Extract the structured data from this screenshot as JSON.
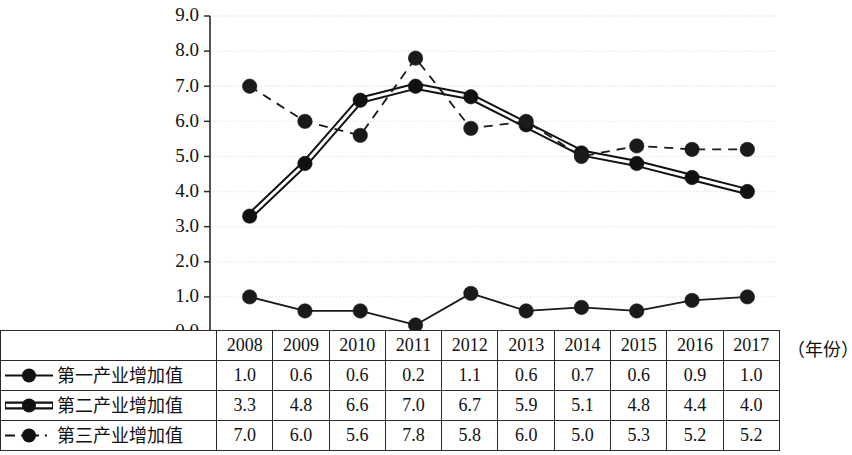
{
  "chart_data": {
    "type": "line",
    "title": "",
    "xlabel": "（年份）",
    "ylabel": "",
    "categories": [
      "2008",
      "2009",
      "2010",
      "2011",
      "2012",
      "2013",
      "2014",
      "2015",
      "2016",
      "2017"
    ],
    "ylim": [
      0.0,
      9.0
    ],
    "ytick_step": 1.0,
    "yticks": [
      "0.0",
      "1.0",
      "2.0",
      "3.0",
      "4.0",
      "5.0",
      "6.0",
      "7.0",
      "8.0",
      "9.0"
    ],
    "grid": true,
    "legend_position": "table-left-column",
    "series": [
      {
        "name": "第一产业增加值",
        "style": "solid-thin",
        "marker": "filled-circle",
        "color": "#1a1a1a",
        "values": [
          1.0,
          0.6,
          0.6,
          0.2,
          1.1,
          0.6,
          0.7,
          0.6,
          0.9,
          1.0
        ]
      },
      {
        "name": "第二产业增加值",
        "style": "double-solid-thick",
        "marker": "filled-circle",
        "color": "#111111",
        "values": [
          3.3,
          4.8,
          6.6,
          7.0,
          6.7,
          5.9,
          5.1,
          4.8,
          4.4,
          4.0
        ]
      },
      {
        "name": "第三产业增加值",
        "style": "dashed",
        "marker": "filled-circle",
        "color": "#1a1a1a",
        "values": [
          7.0,
          6.0,
          5.6,
          7.8,
          5.8,
          6.0,
          5.0,
          5.3,
          5.2,
          5.2
        ]
      }
    ]
  },
  "table": {
    "year_header": [
      "2008",
      "2009",
      "2010",
      "2011",
      "2012",
      "2013",
      "2014",
      "2015",
      "2016",
      "2017"
    ],
    "unit_label": "（年份）",
    "rows": [
      {
        "label": "第一产业增加值",
        "swatch": "solid-line-dot-marker",
        "values": [
          "1.0",
          "0.6",
          "0.6",
          "0.2",
          "1.1",
          "0.6",
          "0.7",
          "0.6",
          "0.9",
          "1.0"
        ]
      },
      {
        "label": "第二产业增加值",
        "swatch": "double-line-dot-marker",
        "values": [
          "3.3",
          "4.8",
          "6.6",
          "7.0",
          "6.7",
          "5.9",
          "5.1",
          "4.8",
          "4.4",
          "4.0"
        ]
      },
      {
        "label": "第三产业增加值",
        "swatch": "dashed-line-dot-marker",
        "values": [
          "7.0",
          "6.0",
          "5.6",
          "7.8",
          "5.8",
          "6.0",
          "5.0",
          "5.3",
          "5.2",
          "5.2"
        ]
      }
    ]
  },
  "axis": {
    "ytick_labels": [
      "9.0",
      "8.0",
      "7.0",
      "6.0",
      "5.0",
      "4.0",
      "3.0",
      "2.0",
      "1.0",
      "0.0"
    ]
  },
  "colors": {
    "ink": "#111111",
    "grid": "#e9e9ee",
    "axis": "#2a2a2a"
  }
}
